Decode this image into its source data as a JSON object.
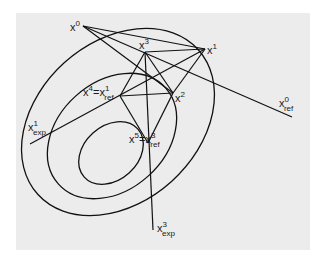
{
  "diagram": {
    "background_color": "#ececec",
    "line_color": "#111111",
    "contours": [
      {
        "name": "outer",
        "cx": 118,
        "cy": 122,
        "rx": 108,
        "ry": 80,
        "rotate": -42
      },
      {
        "name": "middle",
        "cx": 112,
        "cy": 136,
        "rx": 72,
        "ry": 54,
        "rotate": -42
      },
      {
        "name": "inner",
        "cx": 111,
        "cy": 153,
        "rx": 36,
        "ry": 27,
        "rotate": -42
      }
    ],
    "points": {
      "x0": {
        "x": 83,
        "y": 26
      },
      "x1": {
        "x": 205,
        "y": 49
      },
      "x2": {
        "x": 173,
        "y": 93
      },
      "x3": {
        "x": 145,
        "y": 52
      },
      "x4": {
        "x": 120,
        "y": 96
      },
      "x5": {
        "x": 148,
        "y": 143
      },
      "x0_ref_end": {
        "x": 292,
        "y": 117
      },
      "x1_exp_end": {
        "x": 30,
        "y": 144
      },
      "x3_exp_end": {
        "x": 153,
        "y": 230
      }
    },
    "labels": {
      "x0": {
        "base": "x",
        "sup": "0"
      },
      "x1": {
        "base": "x",
        "sup": "1"
      },
      "x2": {
        "base": "x",
        "sup": "2"
      },
      "x3": {
        "base": "x",
        "sup": "3"
      },
      "x4_eq": {
        "base": "x",
        "sup": "4",
        "eq": "=",
        "base2": "x",
        "sup2": "1",
        "sub2": "ref"
      },
      "x5_eq": {
        "base": "x",
        "sup": "5",
        "eq": "=",
        "base2": "x",
        "sup2": "3",
        "sub2": "ref"
      },
      "x0_ref": {
        "base": "x",
        "sup": "0",
        "sub": "ref"
      },
      "x1_exp": {
        "base": "x",
        "sup": "1",
        "sub": "exp"
      },
      "x3_exp": {
        "base": "x",
        "sup": "3",
        "sub": "exp"
      }
    }
  }
}
